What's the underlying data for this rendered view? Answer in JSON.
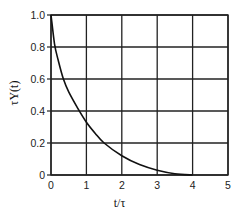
{
  "chart_data": {
    "type": "line",
    "title": "",
    "xlabel": "t/τ",
    "ylabel": "τY(t)",
    "xlim": [
      0,
      5
    ],
    "ylim": [
      0,
      1.0
    ],
    "grid": true,
    "x_ticks": [
      "0",
      "1",
      "2",
      "3",
      "4",
      "5"
    ],
    "y_ticks": [
      "0",
      "0.2",
      "0.4",
      "0.6",
      "0.8",
      "1.0"
    ],
    "series": [
      {
        "name": "τY(t)",
        "x": [
          0,
          0.1,
          0.2,
          0.35,
          0.5,
          0.75,
          1.0,
          1.25,
          1.5,
          2.0,
          2.5,
          3.0,
          3.5,
          4.0
        ],
        "values": [
          1.0,
          0.82,
          0.72,
          0.6,
          0.52,
          0.42,
          0.33,
          0.26,
          0.2,
          0.12,
          0.065,
          0.03,
          0.008,
          0.0
        ]
      }
    ]
  }
}
